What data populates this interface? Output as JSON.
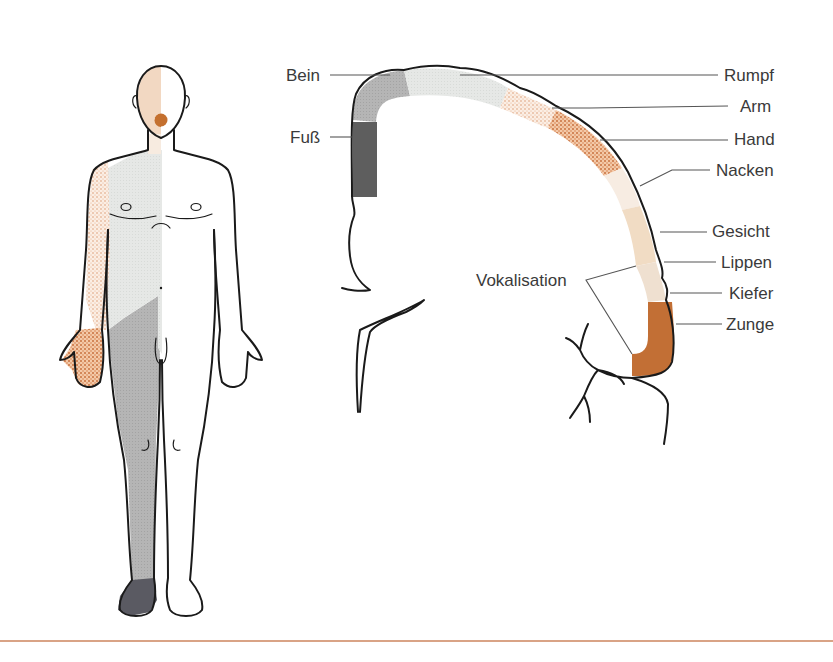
{
  "figure": {
    "labels": {
      "bein": "Bein",
      "fuss": "Fuß",
      "rumpf": "Rumpf",
      "arm": "Arm",
      "hand": "Hand",
      "nacken": "Nacken",
      "gesicht": "Gesicht",
      "lippen": "Lippen",
      "kiefer": "Kiefer",
      "zunge": "Zunge",
      "vokalisation": "Vokalisation"
    },
    "colors": {
      "bein": "#bdbdbd",
      "fuss": "#5e5e5e",
      "rumpf": "#e4e6e4",
      "arm": "#f0c8a8",
      "hand": "#d9885a",
      "nacken": "#f7ece2",
      "gesicht": "#f1dcc4",
      "lippen": "#efe0d0",
      "zunge": "#c26f35",
      "rule": "#d9a386"
    }
  }
}
